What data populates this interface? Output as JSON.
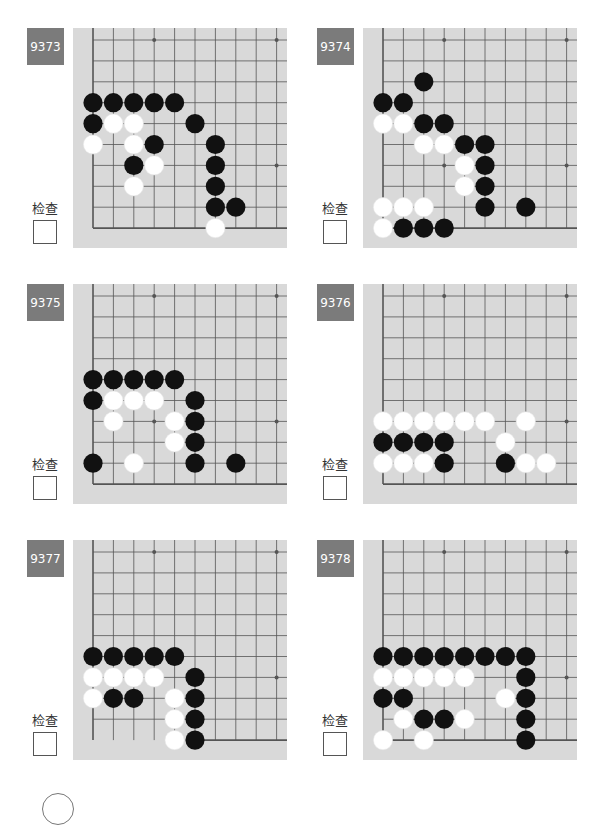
{
  "check_label": "检查",
  "colors": {
    "label_bg": "#7b7b7b",
    "board_bg": "#d9d9d9",
    "grid_line": "#555555",
    "black_stone": "#111111",
    "white_stone": "#ffffff"
  },
  "problems": [
    {
      "id": "9373",
      "bottom_edge_from_col": 0,
      "black": [
        [
          0,
          3
        ],
        [
          1,
          3
        ],
        [
          2,
          3
        ],
        [
          3,
          3
        ],
        [
          4,
          3
        ],
        [
          0,
          4
        ],
        [
          5,
          4
        ],
        [
          3,
          5
        ],
        [
          6,
          5
        ],
        [
          2,
          6
        ],
        [
          6,
          6
        ],
        [
          6,
          7
        ],
        [
          6,
          8
        ],
        [
          7,
          8
        ]
      ],
      "white": [
        [
          1,
          4
        ],
        [
          2,
          4
        ],
        [
          0,
          5
        ],
        [
          2,
          5
        ],
        [
          3,
          6
        ],
        [
          2,
          7
        ],
        [
          6,
          9
        ]
      ]
    },
    {
      "id": "9374",
      "bottom_edge_from_col": 0,
      "black": [
        [
          2,
          2
        ],
        [
          0,
          3
        ],
        [
          1,
          3
        ],
        [
          2,
          4
        ],
        [
          3,
          4
        ],
        [
          4,
          5
        ],
        [
          5,
          5
        ],
        [
          5,
          6
        ],
        [
          5,
          7
        ],
        [
          5,
          8
        ],
        [
          7,
          8
        ],
        [
          1,
          9
        ],
        [
          2,
          9
        ],
        [
          3,
          9
        ]
      ],
      "white": [
        [
          0,
          4
        ],
        [
          1,
          4
        ],
        [
          2,
          5
        ],
        [
          3,
          5
        ],
        [
          4,
          6
        ],
        [
          4,
          7
        ],
        [
          0,
          8
        ],
        [
          1,
          8
        ],
        [
          2,
          8
        ],
        [
          0,
          9
        ]
      ]
    },
    {
      "id": "9375",
      "bottom_edge_from_col": 0,
      "black": [
        [
          0,
          4
        ],
        [
          1,
          4
        ],
        [
          2,
          4
        ],
        [
          3,
          4
        ],
        [
          4,
          4
        ],
        [
          0,
          5
        ],
        [
          5,
          5
        ],
        [
          5,
          6
        ],
        [
          5,
          7
        ],
        [
          0,
          8
        ],
        [
          5,
          8
        ],
        [
          7,
          8
        ]
      ],
      "white": [
        [
          1,
          5
        ],
        [
          2,
          5
        ],
        [
          3,
          5
        ],
        [
          1,
          6
        ],
        [
          4,
          6
        ],
        [
          4,
          7
        ],
        [
          2,
          8
        ]
      ]
    },
    {
      "id": "9376",
      "bottom_edge_from_col": 0,
      "black": [
        [
          0,
          7
        ],
        [
          1,
          7
        ],
        [
          2,
          7
        ],
        [
          3,
          7
        ],
        [
          3,
          8
        ],
        [
          6,
          8
        ]
      ],
      "white": [
        [
          0,
          6
        ],
        [
          1,
          6
        ],
        [
          2,
          6
        ],
        [
          3,
          6
        ],
        [
          4,
          6
        ],
        [
          5,
          6
        ],
        [
          7,
          6
        ],
        [
          6,
          7
        ],
        [
          0,
          8
        ],
        [
          1,
          8
        ],
        [
          2,
          8
        ],
        [
          7,
          8
        ],
        [
          8,
          8
        ]
      ]
    },
    {
      "id": "9377",
      "bottom_edge_from_col": 5,
      "black": [
        [
          0,
          5
        ],
        [
          1,
          5
        ],
        [
          2,
          5
        ],
        [
          3,
          5
        ],
        [
          4,
          5
        ],
        [
          5,
          6
        ],
        [
          1,
          7
        ],
        [
          2,
          7
        ],
        [
          5,
          7
        ],
        [
          5,
          8
        ],
        [
          5,
          9
        ]
      ],
      "white": [
        [
          0,
          6
        ],
        [
          1,
          6
        ],
        [
          2,
          6
        ],
        [
          3,
          6
        ],
        [
          0,
          7
        ],
        [
          4,
          7
        ],
        [
          4,
          8
        ],
        [
          4,
          9
        ]
      ]
    },
    {
      "id": "9378",
      "bottom_edge_from_col": 0,
      "black": [
        [
          0,
          5
        ],
        [
          1,
          5
        ],
        [
          2,
          5
        ],
        [
          3,
          5
        ],
        [
          4,
          5
        ],
        [
          5,
          5
        ],
        [
          6,
          5
        ],
        [
          7,
          5
        ],
        [
          7,
          6
        ],
        [
          0,
          7
        ],
        [
          1,
          7
        ],
        [
          7,
          7
        ],
        [
          2,
          8
        ],
        [
          3,
          8
        ],
        [
          7,
          8
        ],
        [
          7,
          9
        ]
      ],
      "white": [
        [
          0,
          6
        ],
        [
          1,
          6
        ],
        [
          2,
          6
        ],
        [
          3,
          6
        ],
        [
          4,
          6
        ],
        [
          6,
          7
        ],
        [
          1,
          8
        ],
        [
          4,
          8
        ],
        [
          0,
          9
        ],
        [
          2,
          9
        ]
      ]
    }
  ]
}
